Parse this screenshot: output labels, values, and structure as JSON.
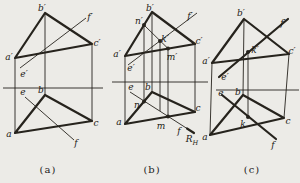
{
  "canvas": {
    "width": 300,
    "height": 183,
    "background": "#ecebe7",
    "line_color": "#26231d",
    "label_color": "#1c1a15"
  },
  "styles": {
    "thick": 2.2,
    "thin": 0.9,
    "dot_radius": 2,
    "label_size": 9,
    "sub_size": 6.5
  },
  "figures": [
    {
      "id": "a",
      "caption": "(a)",
      "ground": {
        "x1": 3,
        "y": 88,
        "x2": 103
      },
      "thick": [
        {
          "name": "triangle-abc-front-view",
          "closed": true,
          "points": [
            [
              15,
              58
            ],
            [
              45,
              13
            ],
            [
              92,
              44
            ]
          ]
        },
        {
          "name": "triangle-abc-top-view",
          "closed": true,
          "points": [
            [
              15,
              133
            ],
            [
              45,
              95
            ],
            [
              92,
              121
            ]
          ]
        }
      ],
      "thin": [
        {
          "name": "line-ef-front-view",
          "points": [
            [
              20,
              68
            ],
            [
              86,
              18
            ]
          ]
        },
        {
          "name": "line-ef-top-view",
          "points": [
            [
              25,
              97
            ],
            [
              74,
              140
            ]
          ]
        },
        {
          "name": "projector-a",
          "points": [
            [
              15,
              58
            ],
            [
              15,
              133
            ]
          ]
        },
        {
          "name": "projector-b",
          "points": [
            [
              45,
              13
            ],
            [
              45,
              95
            ]
          ]
        },
        {
          "name": "projector-c",
          "points": [
            [
              92,
              44
            ],
            [
              92,
              121
            ]
          ]
        }
      ],
      "dots": [],
      "labels": [
        {
          "name": "label-a-prime",
          "text": "a′",
          "x": 9,
          "y": 57
        },
        {
          "name": "label-b-prime",
          "text": "b′",
          "x": 42,
          "y": 8
        },
        {
          "name": "label-f-prime",
          "text": "f′",
          "x": 90,
          "y": 17
        },
        {
          "name": "label-c-prime",
          "text": "c′",
          "x": 97,
          "y": 43
        },
        {
          "name": "label-e-prime",
          "text": "e′",
          "x": 24,
          "y": 74
        },
        {
          "name": "label-e",
          "text": "e",
          "x": 23,
          "y": 92
        },
        {
          "name": "label-b",
          "text": "b",
          "x": 41,
          "y": 90
        },
        {
          "name": "label-c",
          "text": "c",
          "x": 96,
          "y": 123
        },
        {
          "name": "label-a",
          "text": "a",
          "x": 9,
          "y": 134
        },
        {
          "name": "label-f",
          "text": "f",
          "x": 76,
          "y": 143
        }
      ]
    },
    {
      "id": "b",
      "caption": "(b)",
      "ground": {
        "x1": 112,
        "y": 82,
        "x2": 208
      },
      "thick": [
        {
          "name": "triangle-abc-front-view",
          "closed": true,
          "points": [
            [
              125,
              56
            ],
            [
              152,
              12
            ],
            [
              195,
              44
            ]
          ]
        },
        {
          "name": "triangle-abc-top-view",
          "closed": true,
          "points": [
            [
              125,
              124
            ],
            [
              152,
              92
            ],
            [
              195,
              112
            ]
          ]
        },
        {
          "name": "trace-RH-tick",
          "closed": false,
          "points": [
            [
              187,
              128.5
            ],
            [
              194,
              133
            ]
          ]
        }
      ],
      "thin": [
        {
          "name": "line-ef-front-view",
          "points": [
            [
              128,
              65
            ],
            [
              197,
              13
            ]
          ]
        },
        {
          "name": "line-nm-front-view",
          "points": [
            [
              144,
              25
            ],
            [
              168,
              48.5
            ]
          ]
        },
        {
          "name": "line-ef-top-view",
          "points": [
            [
              130,
              92
            ],
            [
              187,
              128.5
            ]
          ]
        },
        {
          "name": "projector-a",
          "points": [
            [
              125,
              56
            ],
            [
              125,
              124
            ]
          ]
        },
        {
          "name": "projector-b",
          "points": [
            [
              152,
              12
            ],
            [
              152,
              92
            ]
          ]
        },
        {
          "name": "projector-c",
          "points": [
            [
              195,
              44
            ],
            [
              195,
              112
            ]
          ]
        },
        {
          "name": "projector-n",
          "points": [
            [
              144,
              25
            ],
            [
              144,
              101.5
            ]
          ]
        },
        {
          "name": "projector-k",
          "points": [
            [
              160,
              41
            ],
            [
              160,
              111
            ]
          ]
        },
        {
          "name": "projector-m",
          "points": [
            [
              168,
              48.5
            ],
            [
              168,
              116.5
            ]
          ]
        }
      ],
      "dots": [
        {
          "name": "point-n-prime",
          "x": 144,
          "y": 25
        },
        {
          "name": "point-k-prime",
          "x": 160,
          "y": 41
        },
        {
          "name": "point-m-prime",
          "x": 168,
          "y": 48.5
        },
        {
          "name": "point-n",
          "x": 144,
          "y": 101.5
        },
        {
          "name": "point-m",
          "x": 168,
          "y": 116.5
        }
      ],
      "labels": [
        {
          "name": "label-b-prime",
          "text": "b′",
          "x": 150,
          "y": 8
        },
        {
          "name": "label-n-prime",
          "text": "n′",
          "x": 139,
          "y": 21
        },
        {
          "name": "label-k-prime",
          "text": "k′",
          "x": 165,
          "y": 39
        },
        {
          "name": "label-f-prime",
          "text": "f′",
          "x": 190,
          "y": 16
        },
        {
          "name": "label-c-prime",
          "text": "c′",
          "x": 199,
          "y": 41
        },
        {
          "name": "label-a-prime",
          "text": "a′",
          "x": 117,
          "y": 54
        },
        {
          "name": "label-m-prime",
          "text": "m′",
          "x": 172,
          "y": 57
        },
        {
          "name": "label-e-prime",
          "text": "e′",
          "x": 131,
          "y": 68
        },
        {
          "name": "label-e",
          "text": "e",
          "x": 131,
          "y": 87
        },
        {
          "name": "label-b",
          "text": "b",
          "x": 148,
          "y": 87
        },
        {
          "name": "label-n",
          "text": "n",
          "x": 137,
          "y": 105
        },
        {
          "name": "label-a",
          "text": "a",
          "x": 119,
          "y": 122
        },
        {
          "name": "label-m",
          "text": "m",
          "x": 161,
          "y": 126
        },
        {
          "name": "label-c",
          "text": "c",
          "x": 198,
          "y": 108
        },
        {
          "name": "label-f",
          "text": "f",
          "x": 179,
          "y": 131
        },
        {
          "name": "label-RH",
          "text": "R",
          "sub": "H",
          "x": 192,
          "y": 139
        }
      ]
    },
    {
      "id": "c",
      "caption": "(c)",
      "ground": {
        "x1": 216,
        "y": 90,
        "x2": 299
      },
      "thick": [
        {
          "name": "triangle-abc-front-view",
          "closed": true,
          "points": [
            [
              212,
              63
            ],
            [
              244,
              19
            ],
            [
              289,
              54
            ]
          ]
        },
        {
          "name": "triangle-abc-top-view",
          "closed": true,
          "points": [
            [
              210,
              135
            ],
            [
              243,
              95
            ],
            [
              284,
              118
            ]
          ]
        },
        {
          "name": "line-ef-front-view",
          "closed": false,
          "points": [
            [
              219,
              77
            ],
            [
              288,
              19
            ]
          ]
        },
        {
          "name": "line-ef-top-view",
          "closed": false,
          "points": [
            [
              222,
              95
            ],
            [
              276,
              139
            ]
          ]
        }
      ],
      "thin": [
        {
          "name": "projector-a",
          "points": [
            [
              212,
              63
            ],
            [
              210,
              135
            ]
          ]
        },
        {
          "name": "projector-b",
          "points": [
            [
              244,
              19
            ],
            [
              243,
              95
            ]
          ]
        },
        {
          "name": "projector-c",
          "points": [
            [
              289,
              54
            ],
            [
              284,
              118
            ]
          ]
        },
        {
          "name": "projector-k",
          "points": [
            [
              248,
              52
            ],
            [
              248,
              117
            ]
          ]
        }
      ],
      "dots": [
        {
          "name": "point-k-prime",
          "x": 248,
          "y": 52
        },
        {
          "name": "point-k",
          "x": 248,
          "y": 117
        }
      ],
      "labels": [
        {
          "name": "label-b-prime",
          "text": "b′",
          "x": 241,
          "y": 13
        },
        {
          "name": "label-f-prime",
          "text": "f′",
          "x": 283,
          "y": 23
        },
        {
          "name": "label-k-prime",
          "text": "k′",
          "x": 255,
          "y": 50
        },
        {
          "name": "label-c-prime",
          "text": "c′",
          "x": 292,
          "y": 51
        },
        {
          "name": "label-a-prime",
          "text": "a′",
          "x": 206,
          "y": 61
        },
        {
          "name": "label-e-prime",
          "text": "e′",
          "x": 225,
          "y": 77
        },
        {
          "name": "label-e",
          "text": "e",
          "x": 221,
          "y": 93
        },
        {
          "name": "label-b",
          "text": "b",
          "x": 238,
          "y": 92
        },
        {
          "name": "label-c",
          "text": "c",
          "x": 288,
          "y": 121
        },
        {
          "name": "label-a",
          "text": "a",
          "x": 205,
          "y": 137
        },
        {
          "name": "label-k",
          "text": "k",
          "x": 243,
          "y": 124
        },
        {
          "name": "label-f",
          "text": "f",
          "x": 273,
          "y": 145
        }
      ]
    }
  ]
}
